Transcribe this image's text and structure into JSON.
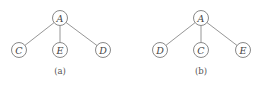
{
  "diagrams": [
    {
      "caption": "(a)",
      "root": {
        "label": "A",
        "x": 60,
        "y": 18
      },
      "children": [
        {
          "label": "C",
          "x": 19,
          "y": 50
        },
        {
          "label": "E",
          "x": 60,
          "y": 50
        },
        {
          "label": "D",
          "x": 103,
          "y": 50
        }
      ],
      "caption_pos": {
        "x": 60,
        "y": 71
      }
    },
    {
      "caption": "(b)",
      "root": {
        "label": "A",
        "x": 201,
        "y": 18
      },
      "children": [
        {
          "label": "D",
          "x": 160,
          "y": 50
        },
        {
          "label": "C",
          "x": 201,
          "y": 50
        },
        {
          "label": "E",
          "x": 243,
          "y": 50
        }
      ],
      "caption_pos": {
        "x": 201,
        "y": 71
      }
    }
  ],
  "style": {
    "node_radius": 7.5,
    "stroke_color": "#7a7a7a"
  }
}
